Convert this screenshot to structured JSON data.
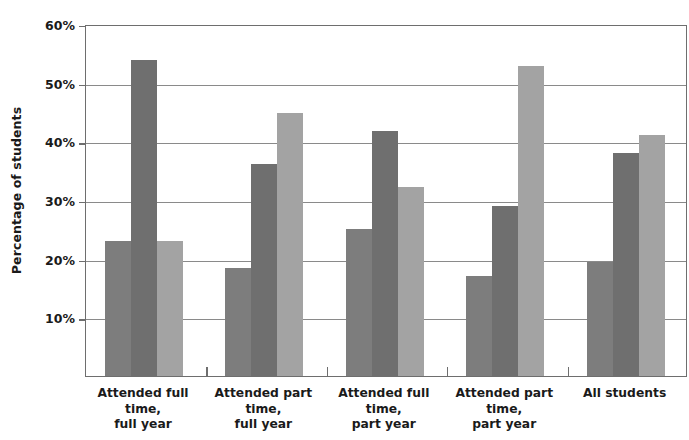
{
  "chart_data": {
    "type": "bar",
    "title": "",
    "subtitle": "",
    "xlabel": "",
    "ylabel": "Percentage of students",
    "ylim": [
      0,
      60
    ],
    "ytick_labels": [
      "60%",
      "50%",
      "40%",
      "30%",
      "20%",
      "10%"
    ],
    "ytick_values": [
      60,
      50,
      40,
      30,
      20,
      10
    ],
    "ytick_suffix": "%",
    "grid": true,
    "legend": "none",
    "categories": [
      "Attended full time,\nfull year",
      "Attended part time,\nfull year",
      "Attended full time,\npart year",
      "Attended part time,\npart year",
      "All students"
    ],
    "category_lines": [
      [
        "Attended full time,",
        "full year"
      ],
      [
        "Attended part time,",
        "full year"
      ],
      [
        "Attended full time,",
        "part year"
      ],
      [
        "Attended part time,",
        "part year"
      ],
      [
        "All students",
        ""
      ]
    ],
    "series": [
      {
        "name": "series-1",
        "color": "#7d7d7d",
        "values": [
          23.0,
          18.4,
          25.1,
          17.1,
          19.5
        ]
      },
      {
        "name": "series-2",
        "color": "#6f6f6f",
        "values": [
          53.8,
          36.2,
          41.7,
          29.0,
          38.0
        ]
      },
      {
        "name": "series-3",
        "color": "#a3a3a3",
        "values": [
          23.0,
          44.9,
          32.2,
          52.8,
          41.0
        ]
      }
    ]
  },
  "colors": {
    "series_1": "#7d7d7d",
    "series_2": "#6f6f6f",
    "series_3": "#a3a3a3",
    "axis": "#6e6e6e",
    "gridline": "#8a8a8a",
    "text": "#1a1a1a",
    "background": "#ffffff"
  }
}
